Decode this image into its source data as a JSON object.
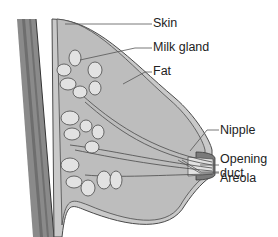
{
  "diagram": {
    "colors": {
      "chest_wall": "#8a8a8a",
      "chest_wall_dark": "#6e6e6e",
      "skin": "#c9c9c9",
      "fat": "#bdbdbd",
      "gland": "#e2e2e2",
      "outline": "#4a4a4a",
      "nipple": "#7a7a7a"
    },
    "labels": [
      {
        "id": "skin",
        "text": "Skin"
      },
      {
        "id": "milk_gland",
        "text": "Milk gland"
      },
      {
        "id": "fat",
        "text": "Fat"
      },
      {
        "id": "nipple",
        "text": "Nipple"
      },
      {
        "id": "opening_duct_1",
        "text": "Opening"
      },
      {
        "id": "opening_duct_2",
        "text": "duct"
      },
      {
        "id": "areola",
        "text": "Areola"
      }
    ]
  }
}
